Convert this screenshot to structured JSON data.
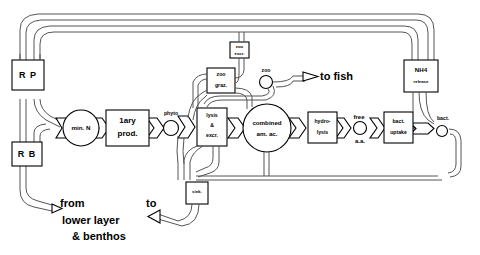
{
  "diagram": {
    "nodes": {
      "rp": "R P",
      "rb": "R B",
      "min_n": "min. N",
      "primary_prod_line1": "1ary",
      "primary_prod_line2": "prod.",
      "phyto": "phyto",
      "zoo_graz_line1": "zoo",
      "zoo_graz_line2": "graz.",
      "zoo_excr_line1": "zoo",
      "zoo_excr_line2": "excr.",
      "zoo": "zoo",
      "lysis_line1": "lysis",
      "lysis_line2": "&",
      "lysis_line3": "excr.",
      "combined_line1": "combined",
      "combined_line2": "am. ac.",
      "hydro_line1": "hydro-",
      "hydro_line2": "lysis",
      "free_aa_line1": "free",
      "free_aa_line2": "a.a.",
      "bact_uptake_line1": "bact.",
      "bact_uptake_line2": "uptake",
      "bact": "bact.",
      "nh4_release_line1": "NH4",
      "nh4_release_line2": "release",
      "sink": "sink."
    },
    "annotations": {
      "to_fish": "to fish",
      "from": "from",
      "lower_layer": "lower  layer",
      "benthos": "&  benthos",
      "to": "to"
    },
    "colors": {
      "stroke": "#000000",
      "pipe": "#555555",
      "background": "#ffffff"
    }
  }
}
